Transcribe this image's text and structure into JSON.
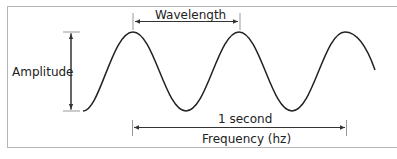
{
  "diagram": {
    "labels": {
      "wavelength": "Wavelength",
      "amplitude": "Amplitude",
      "duration": "1 second",
      "frequency": "Frequency (hz)"
    },
    "colors": {
      "wave": "#222222",
      "arrows": "#333333",
      "frame": "#b5b5b5",
      "ticks": "#999999"
    }
  }
}
